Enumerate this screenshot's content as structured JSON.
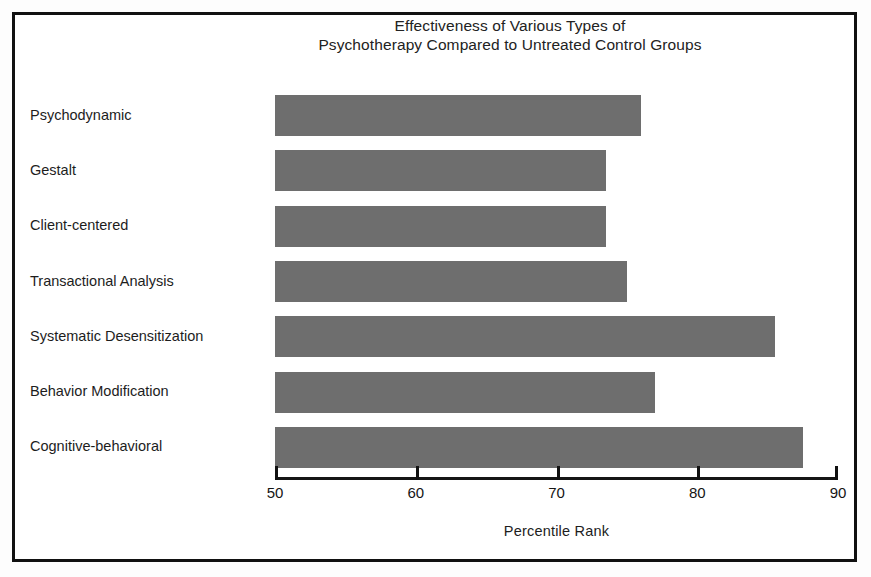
{
  "chart_data": {
    "type": "bar",
    "orientation": "horizontal",
    "title": "Effectiveness of Various Types of Psychotherapy Compared to Untreated Control Groups",
    "title_lines": [
      "Effectiveness of Various Types of",
      "Psychotherapy Compared to Untreated Control Groups"
    ],
    "xlabel": "Percentile Rank",
    "ylabel": "",
    "xlim": [
      50,
      90
    ],
    "xticks": [
      50,
      60,
      70,
      80,
      90
    ],
    "xtick_labels": [
      "50",
      "60",
      "70",
      "80",
      "90"
    ],
    "grid": false,
    "legend": false,
    "bar_color": "#6e6e6e",
    "frame_color": "#111111",
    "categories": [
      "Psychodynamic",
      "Gestalt",
      "Client-centered",
      "Transactional Analysis",
      "Systematic Desensitization",
      "Behavior Modification",
      "Cognitive-behavioral"
    ],
    "values": [
      76,
      73.5,
      73.5,
      75,
      85.5,
      77,
      87.5
    ],
    "series": [
      {
        "name": "Percentile Rank",
        "values": [
          76,
          73.5,
          73.5,
          75,
          85.5,
          77,
          87.5
        ]
      }
    ]
  }
}
